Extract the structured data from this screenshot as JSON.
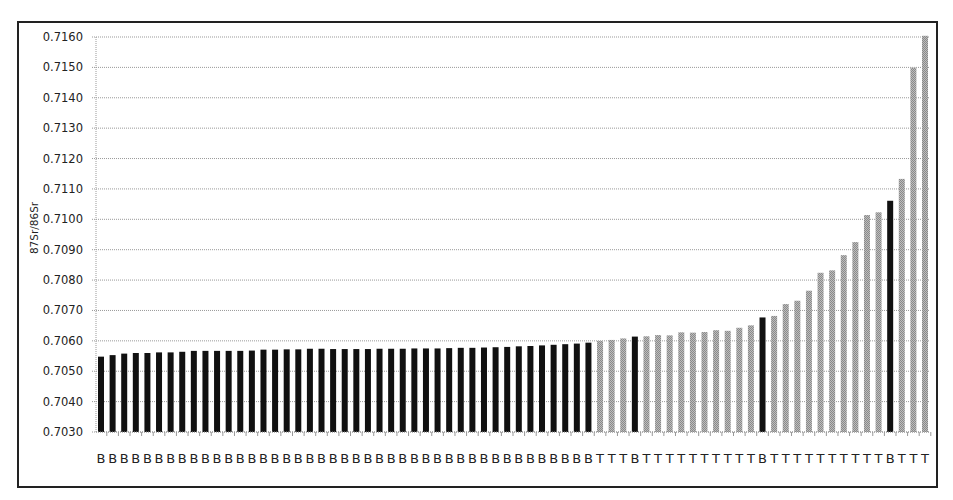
{
  "chart_data": {
    "type": "bar",
    "title": "",
    "xlabel": "",
    "ylabel": "87Sr/86Sr",
    "ylim": [
      0.703,
      0.716
    ],
    "yticks": [
      "0.7030",
      "0.7040",
      "0.7050",
      "0.7060",
      "0.7070",
      "0.7080",
      "0.7090",
      "0.7100",
      "0.7110",
      "0.7120",
      "0.7130",
      "0.7140",
      "0.7150",
      "0.7160"
    ],
    "grid": true,
    "legend": null,
    "colors": {
      "B": "#111111",
      "T": "#a6a6a6"
    },
    "categories": [
      "B",
      "B",
      "B",
      "B",
      "B",
      "B",
      "B",
      "B",
      "B",
      "B",
      "B",
      "B",
      "B",
      "B",
      "B",
      "B",
      "B",
      "B",
      "B",
      "B",
      "B",
      "B",
      "B",
      "B",
      "B",
      "B",
      "B",
      "B",
      "B",
      "B",
      "B",
      "B",
      "B",
      "B",
      "B",
      "B",
      "B",
      "B",
      "B",
      "B",
      "B",
      "B",
      "B",
      "T",
      "T",
      "T",
      "B",
      "T",
      "T",
      "T",
      "T",
      "T",
      "T",
      "T",
      "T",
      "T",
      "T",
      "B",
      "T",
      "T",
      "T",
      "T",
      "T",
      "T",
      "T",
      "T",
      "T",
      "T",
      "B",
      "T",
      "T",
      "T"
    ],
    "values": [
      0.70548,
      0.70553,
      0.70558,
      0.7056,
      0.7056,
      0.70562,
      0.70562,
      0.70564,
      0.70567,
      0.70567,
      0.70567,
      0.70567,
      0.70567,
      0.70568,
      0.70571,
      0.70571,
      0.70572,
      0.70572,
      0.70574,
      0.70574,
      0.70573,
      0.70573,
      0.70573,
      0.70573,
      0.70574,
      0.70574,
      0.70574,
      0.70575,
      0.70575,
      0.70575,
      0.70576,
      0.70577,
      0.70577,
      0.70578,
      0.70579,
      0.7058,
      0.70582,
      0.70583,
      0.70585,
      0.70587,
      0.70589,
      0.70591,
      0.70594,
      0.706,
      0.70603,
      0.70608,
      0.70614,
      0.70615,
      0.70619,
      0.70618,
      0.70628,
      0.70627,
      0.70629,
      0.70635,
      0.70633,
      0.70643,
      0.70651,
      0.70677,
      0.70682,
      0.70721,
      0.70732,
      0.70765,
      0.70824,
      0.70832,
      0.70882,
      0.70925,
      0.71014,
      0.71023,
      0.71061,
      0.71133,
      0.71499,
      0.71604
    ]
  }
}
